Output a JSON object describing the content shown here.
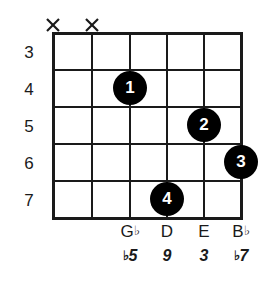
{
  "diagram": {
    "type": "guitar-chord-diagram",
    "strings_count": 6,
    "fret_numbers": [
      "3",
      "4",
      "5",
      "6",
      "7"
    ],
    "mutes": [
      {
        "string": 1,
        "marker": "X"
      },
      {
        "string": 2,
        "marker": "X"
      }
    ],
    "fingers": [
      {
        "label": "1",
        "string": 3,
        "fret": 4
      },
      {
        "label": "2",
        "string": 5,
        "fret": 5
      },
      {
        "label": "3",
        "string": 6,
        "fret": 6
      },
      {
        "label": "4",
        "string": 4,
        "fret": 7
      }
    ],
    "note_names": [
      {
        "letter": "G",
        "accidental": "♭"
      },
      {
        "letter": "D",
        "accidental": ""
      },
      {
        "letter": "E",
        "accidental": ""
      },
      {
        "letter": "B",
        "accidental": "♭"
      }
    ],
    "intervals": [
      {
        "accidental": "♭",
        "degree": "5"
      },
      {
        "accidental": "",
        "degree": "9"
      },
      {
        "accidental": "",
        "degree": "3"
      },
      {
        "accidental": "♭",
        "degree": "7"
      }
    ],
    "colors": {
      "ink": "#1a1a1a",
      "dot_fill": "#000000",
      "dot_text": "#ffffff",
      "background": "#ffffff"
    }
  }
}
